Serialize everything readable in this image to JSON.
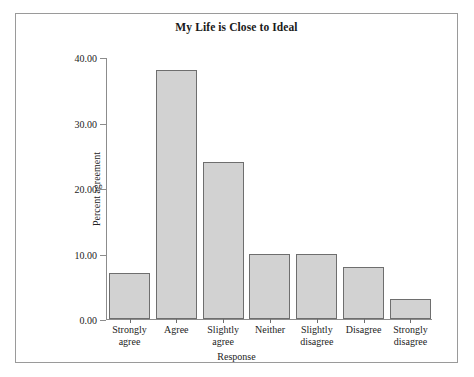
{
  "figure": {
    "title": "My Life is Close to Ideal",
    "frame_color": "#9a9a9a",
    "background": "#ffffff"
  },
  "chart_data": {
    "type": "bar",
    "title": "My Life is Close to Ideal",
    "xlabel": "Response",
    "ylabel": "Percent agreement",
    "categories": [
      "Strongly agree",
      "Agree",
      "Slightly agree",
      "Neither",
      "Slightly disagree",
      "Disagree",
      "Strongly disagree"
    ],
    "category_lines": [
      [
        "Strongly",
        "agree"
      ],
      [
        "Agree",
        ""
      ],
      [
        "Slightly",
        "agree"
      ],
      [
        "Neither",
        ""
      ],
      [
        "Slightly",
        "disagree"
      ],
      [
        "Disagree",
        ""
      ],
      [
        "Strongly",
        "disagree"
      ]
    ],
    "values": [
      7,
      38,
      24,
      10,
      10,
      8,
      3
    ],
    "ylim": [
      0,
      40
    ],
    "ytick_values": [
      40,
      30,
      20,
      10,
      0
    ],
    "ytick_labels": [
      "40.00",
      "30.00",
      "20.00",
      "10.00",
      "0.00"
    ],
    "grid": false,
    "legend": false,
    "bar_fill": "#d2d2d2",
    "bar_edge": "#6e6e6e"
  }
}
